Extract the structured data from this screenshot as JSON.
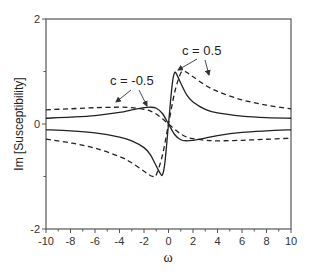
{
  "chart_data": {
    "type": "line",
    "title": "",
    "xlabel": "ω",
    "ylabel": "Im [Susceptibility]",
    "xlim": [
      -10,
      10
    ],
    "ylim": [
      -2,
      2
    ],
    "x_ticks": [
      -10,
      -8,
      -6,
      -4,
      -2,
      0,
      2,
      4,
      6,
      8,
      10
    ],
    "x_tick_labels": [
      "-10",
      "-8",
      "-6",
      "-4",
      "-2",
      "0",
      "2",
      "4",
      "6",
      "8",
      "10"
    ],
    "y_ticks": [
      -2,
      0,
      2
    ],
    "y_tick_labels": [
      "-2",
      "0",
      "2"
    ],
    "y_minor_ticks": [
      -1,
      1
    ],
    "grid": false,
    "legend": null,
    "annotations": [
      {
        "text": "c = -0.5",
        "x": -2.8,
        "y": 0.75
      },
      {
        "text": "c = 0.5",
        "x": 1.5,
        "y": 1.3
      }
    ],
    "series": [
      {
        "name": "c = 0.5 (solid)",
        "style": "solid",
        "x": [
          -10,
          -8,
          -6,
          -4,
          -3,
          -2,
          -1.5,
          -1,
          -0.7,
          -0.5,
          -0.3,
          0,
          0.3,
          0.5,
          0.7,
          1,
          1.5,
          2,
          3,
          4,
          6,
          8,
          10
        ],
        "values": [
          -0.11,
          -0.13,
          -0.17,
          -0.25,
          -0.32,
          -0.45,
          -0.58,
          -0.8,
          -0.93,
          -0.97,
          -0.75,
          0,
          0.75,
          0.98,
          0.93,
          0.78,
          0.55,
          0.42,
          0.28,
          0.21,
          0.15,
          0.12,
          0.11
        ]
      },
      {
        "name": "c = 0.5 (dashed)",
        "style": "dashed",
        "x": [
          -10,
          -8,
          -6,
          -4,
          -3,
          -2,
          -1.5,
          -1.2,
          -1,
          -0.5,
          0,
          0.5,
          1,
          1.3,
          1.5,
          2,
          3,
          4,
          6,
          8,
          10
        ],
        "values": [
          -0.29,
          -0.36,
          -0.46,
          -0.62,
          -0.74,
          -0.9,
          -0.98,
          -1.0,
          -0.97,
          -0.6,
          0,
          0.6,
          0.97,
          1.0,
          0.98,
          0.9,
          0.74,
          0.62,
          0.46,
          0.36,
          0.29
        ]
      },
      {
        "name": "c = -0.5 (solid)",
        "style": "solid",
        "x": [
          -10,
          -8,
          -6,
          -4,
          -3,
          -2,
          -1.5,
          -1,
          -0.5,
          0,
          0.5,
          1,
          1.5,
          2,
          3,
          4,
          6,
          8,
          10
        ],
        "values": [
          0.11,
          0.13,
          0.16,
          0.22,
          0.27,
          0.31,
          0.32,
          0.3,
          0.2,
          0,
          -0.2,
          -0.3,
          -0.32,
          -0.31,
          -0.27,
          -0.22,
          -0.16,
          -0.13,
          -0.11
        ]
      },
      {
        "name": "c = -0.5 (dashed)",
        "style": "dashed",
        "x": [
          -10,
          -8,
          -6,
          -4,
          -3,
          -2,
          -1.5,
          -1,
          -0.5,
          0,
          0.5,
          1,
          1.5,
          2,
          3,
          4,
          6,
          8,
          10
        ],
        "values": [
          0.27,
          0.29,
          0.31,
          0.32,
          0.31,
          0.28,
          0.25,
          0.19,
          0.1,
          0,
          -0.1,
          -0.19,
          -0.25,
          -0.28,
          -0.31,
          -0.32,
          -0.31,
          -0.29,
          -0.27
        ]
      }
    ]
  }
}
